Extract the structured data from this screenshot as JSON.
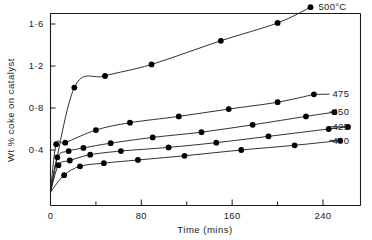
{
  "chart_data": {
    "type": "scatter",
    "title": "",
    "xlabel": "Time (mins)",
    "ylabel": "Wt % coke on catalyst",
    "xlim": [
      0,
      272
    ],
    "ylim": [
      0,
      1.78
    ],
    "grid": false,
    "legend_position": "right-of-curve-ends",
    "x_ticks_major": [
      0,
      80,
      160,
      240
    ],
    "x_tick_labels": [
      "0",
      "80",
      "160",
      "240"
    ],
    "x_ticks_minor": [
      40,
      120,
      200
    ],
    "y_ticks_major": [
      0.4,
      0.8,
      1.2,
      1.6
    ],
    "y_tick_labels": [
      "0·4",
      "0·8",
      "1·2",
      "1·6"
    ],
    "series": [
      {
        "name": "500°C",
        "label": "500°C",
        "points": [
          {
            "x": 21,
            "y": 0.995
          },
          {
            "x": 48,
            "y": 1.105
          },
          {
            "x": 89,
            "y": 1.215
          },
          {
            "x": 150,
            "y": 1.44
          },
          {
            "x": 200,
            "y": 1.61
          },
          {
            "x": 229,
            "y": 1.76
          }
        ]
      },
      {
        "name": "475",
        "label": "475",
        "points": [
          {
            "x": 5,
            "y": 0.455
          },
          {
            "x": 13,
            "y": 0.47
          },
          {
            "x": 40,
            "y": 0.59
          },
          {
            "x": 70,
            "y": 0.66
          },
          {
            "x": 113,
            "y": 0.72
          },
          {
            "x": 157,
            "y": 0.79
          },
          {
            "x": 200,
            "y": 0.855
          },
          {
            "x": 232,
            "y": 0.93
          }
        ]
      },
      {
        "name": "450",
        "label": "450",
        "points": [
          {
            "x": 6,
            "y": 0.33
          },
          {
            "x": 16,
            "y": 0.39
          },
          {
            "x": 29,
            "y": 0.42
          },
          {
            "x": 53,
            "y": 0.465
          },
          {
            "x": 90,
            "y": 0.52
          },
          {
            "x": 133,
            "y": 0.57
          },
          {
            "x": 178,
            "y": 0.64
          },
          {
            "x": 225,
            "y": 0.72
          },
          {
            "x": 250,
            "y": 0.76
          }
        ]
      },
      {
        "name": "425",
        "label": "425",
        "points": [
          {
            "x": 7,
            "y": 0.255
          },
          {
            "x": 17,
            "y": 0.3
          },
          {
            "x": 35,
            "y": 0.355
          },
          {
            "x": 62,
            "y": 0.39
          },
          {
            "x": 104,
            "y": 0.425
          },
          {
            "x": 146,
            "y": 0.47
          },
          {
            "x": 192,
            "y": 0.53
          },
          {
            "x": 245,
            "y": 0.6
          },
          {
            "x": 262,
            "y": 0.62
          }
        ]
      },
      {
        "name": "400",
        "label": "400",
        "points": [
          {
            "x": 12,
            "y": 0.16
          },
          {
            "x": 26,
            "y": 0.245
          },
          {
            "x": 47,
            "y": 0.275
          },
          {
            "x": 77,
            "y": 0.305
          },
          {
            "x": 118,
            "y": 0.345
          },
          {
            "x": 168,
            "y": 0.4
          },
          {
            "x": 215,
            "y": 0.445
          },
          {
            "x": 255,
            "y": 0.49
          }
        ]
      }
    ]
  }
}
